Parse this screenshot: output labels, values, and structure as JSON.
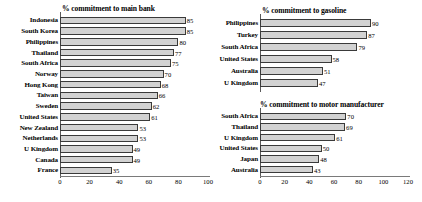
{
  "chart_data": [
    {
      "type": "bar",
      "orientation": "horizontal",
      "title": "% commitment to main bank",
      "xlabel": "",
      "ylabel": "",
      "xlim": [
        0,
        100
      ],
      "xticks": [
        0,
        20,
        40,
        60,
        80,
        100
      ],
      "grid": false,
      "legend": "none",
      "categories": [
        "Indonesia",
        "South Korea",
        "Philippines",
        "Thailand",
        "South Africa",
        "Norway",
        "Hong Kong",
        "Taiwan",
        "Sweden",
        "United States",
        "New Zealand",
        "Netherlands",
        "U Kingdom",
        "Canada",
        "France"
      ],
      "values": [
        85,
        85,
        80,
        77,
        75,
        70,
        68,
        66,
        62,
        61,
        53,
        53,
        49,
        49,
        35
      ]
    },
    {
      "type": "bar",
      "orientation": "horizontal",
      "title": "% commitment to gasoline",
      "xlabel": "",
      "ylabel": "",
      "xlim": [
        0,
        120
      ],
      "xticks": [
        0,
        20,
        40,
        60,
        80,
        100,
        120
      ],
      "grid": false,
      "legend": "none",
      "categories": [
        "Philippines",
        "Turkey",
        "South Africa",
        "United States",
        "Australia",
        "U Kingdom"
      ],
      "values": [
        90,
        87,
        79,
        58,
        51,
        47
      ]
    },
    {
      "type": "bar",
      "orientation": "horizontal",
      "title": "% commitment to motor manufacturer",
      "xlabel": "",
      "ylabel": "",
      "xlim": [
        0,
        120
      ],
      "xticks": [
        0,
        20,
        40,
        60,
        80,
        100,
        120
      ],
      "grid": false,
      "legend": "none",
      "categories": [
        "South Africa",
        "Thailand",
        "U Kingdom",
        "United States",
        "Japan",
        "Australia"
      ],
      "values": [
        70,
        69,
        61,
        50,
        48,
        43
      ]
    }
  ],
  "style": {
    "bar_fill": "#d2d2d2",
    "bar_border": "#3a3a3a",
    "axis_color": "#7a7a7a",
    "text_color": "#000000",
    "background": "#ffffff"
  }
}
